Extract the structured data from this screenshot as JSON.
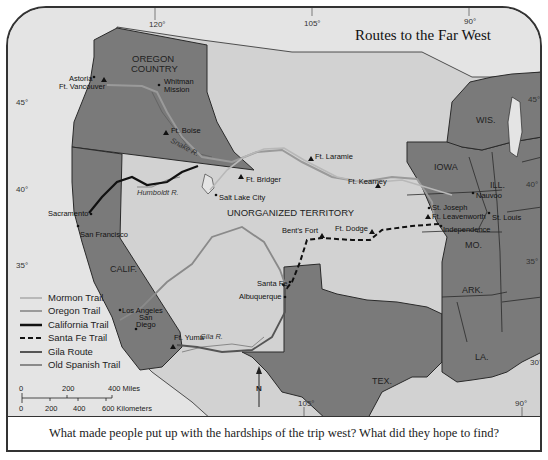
{
  "title": "Routes to the Far West",
  "caption": "What made people put up with the hardships of the trip west?  What did they hope to find?",
  "colors": {
    "water": "#e4e4e4",
    "territory_light": "#d2d2d2",
    "state_dark": "#7a7a7a",
    "border": "#2a2a2a",
    "mormon_trail": "#a8a8a8",
    "oregon_trail": "#9a9a9a",
    "california_trail": "#111111",
    "santa_fe_trail": "#111111",
    "gila_route": "#555555",
    "old_spanish_trail": "#8a8a8a"
  },
  "regions": {
    "oregon_country": [
      "OREGON",
      "COUNTRY"
    ],
    "unorganized": "UNORGANIZED TERRITORY"
  },
  "states": {
    "calif": "CALIF.",
    "tex": "TEX.",
    "iowa": "IOWA",
    "wis": "WIS.",
    "ill": "ILL.",
    "mo": "MO.",
    "ark": "ARK.",
    "la": "LA."
  },
  "rivers": {
    "snake": "Snake R.",
    "humboldt": "Humboldt R.",
    "gila": "Gila R."
  },
  "places": {
    "astoria": "Astoria",
    "ft_vancouver": "Ft. Vancouver",
    "whitman_mission": [
      "Whitman",
      "Mission"
    ],
    "ft_boise": "Ft. Boise",
    "ft_bridger": "Ft. Bridger",
    "salt_lake_city": "Salt Lake City",
    "ft_laramie": "Ft. Laramie",
    "ft_kearney": "Ft. Kearney",
    "sacramento": "Sacramento",
    "san_francisco": "San Francisco",
    "bents_fort": "Bent's Fort",
    "ft_dodge": "Ft. Dodge",
    "santa_fe": "Santa Fe",
    "albuquerque": "Albuquerque",
    "los_angeles": "Los Angeles",
    "san_diego": [
      "San",
      "Diego"
    ],
    "ft_yuma": "Ft. Yuma",
    "st_joseph": "St. Joseph",
    "ft_leavenworth": "Ft. Leavenworth",
    "independence": "Independence",
    "nauvoo": "Nauvoo",
    "st_louis": "St. Louis"
  },
  "graticule": {
    "lon_top": [
      "120°",
      "105°",
      "90°"
    ],
    "lon_bottom": [
      "105°",
      "90°"
    ],
    "lat_left": [
      "45°",
      "40°",
      "35°"
    ],
    "lat_right": [
      "45°",
      "40°",
      "35°",
      "30°"
    ]
  },
  "legend": [
    {
      "label": "Mormon Trail",
      "style": "mormon"
    },
    {
      "label": "Oregon Trail",
      "style": "oregon"
    },
    {
      "label": "California Trail",
      "style": "california"
    },
    {
      "label": "Santa Fe Trail",
      "style": "santafe"
    },
    {
      "label": "Gila Route",
      "style": "gila"
    },
    {
      "label": "Old Spanish Trail",
      "style": "spanish"
    }
  ],
  "scale": {
    "miles_ticks": [
      "0",
      "200",
      "400 Miles"
    ],
    "km_ticks": [
      "0",
      "200",
      "400",
      "600 Kilometers"
    ]
  },
  "compass": "N"
}
